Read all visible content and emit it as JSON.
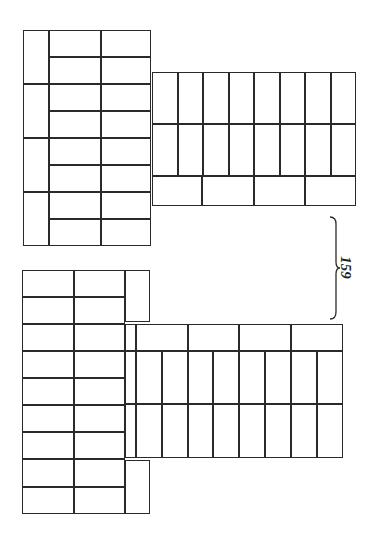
{
  "figure": {
    "stroke_color": "#2a2a2a",
    "background": "#ffffff",
    "reference_label": "159",
    "groups": [
      {
        "name": "upper-pattern",
        "bricks": [
          [
            23,
            30,
            26,
            54
          ],
          [
            23,
            84,
            26,
            54
          ],
          [
            23,
            138,
            26,
            54
          ],
          [
            23,
            192,
            26,
            54
          ],
          [
            49,
            30,
            52,
            27
          ],
          [
            101,
            30,
            50,
            27
          ],
          [
            49,
            57,
            52,
            27
          ],
          [
            101,
            57,
            50,
            27
          ],
          [
            49,
            84,
            52,
            27
          ],
          [
            101,
            84,
            50,
            27
          ],
          [
            49,
            111,
            52,
            27
          ],
          [
            101,
            111,
            50,
            27
          ],
          [
            49,
            138,
            52,
            27
          ],
          [
            101,
            138,
            50,
            27
          ],
          [
            49,
            165,
            52,
            27
          ],
          [
            101,
            165,
            50,
            27
          ],
          [
            49,
            192,
            52,
            27
          ],
          [
            101,
            192,
            50,
            27
          ],
          [
            49,
            219,
            52,
            27
          ],
          [
            101,
            219,
            50,
            27
          ],
          [
            152,
            72,
            26,
            52
          ],
          [
            178,
            72,
            25,
            52
          ],
          [
            203,
            72,
            26,
            52
          ],
          [
            229,
            72,
            25,
            52
          ],
          [
            254,
            72,
            26,
            52
          ],
          [
            280,
            72,
            25,
            52
          ],
          [
            305,
            72,
            26,
            52
          ],
          [
            331,
            72,
            25,
            52
          ],
          [
            152,
            124,
            26,
            52
          ],
          [
            178,
            124,
            25,
            52
          ],
          [
            203,
            124,
            26,
            52
          ],
          [
            229,
            124,
            25,
            52
          ],
          [
            254,
            124,
            26,
            52
          ],
          [
            280,
            124,
            25,
            52
          ],
          [
            305,
            124,
            26,
            52
          ],
          [
            331,
            124,
            25,
            52
          ],
          [
            152,
            176,
            50,
            30
          ],
          [
            202,
            176,
            52,
            30
          ],
          [
            254,
            176,
            51,
            30
          ],
          [
            305,
            176,
            51,
            30
          ]
        ]
      },
      {
        "name": "lower-pattern",
        "bricks": [
          [
            22,
            270,
            52,
            27
          ],
          [
            74,
            270,
            51,
            27
          ],
          [
            22,
            297,
            52,
            27
          ],
          [
            74,
            297,
            51,
            27
          ],
          [
            22,
            324,
            52,
            27
          ],
          [
            74,
            324,
            51,
            27
          ],
          [
            22,
            351,
            52,
            27
          ],
          [
            74,
            351,
            51,
            27
          ],
          [
            22,
            378,
            52,
            27
          ],
          [
            74,
            378,
            51,
            27
          ],
          [
            22,
            405,
            52,
            27
          ],
          [
            74,
            405,
            51,
            27
          ],
          [
            22,
            432,
            52,
            27
          ],
          [
            74,
            432,
            51,
            27
          ],
          [
            22,
            459,
            52,
            28
          ],
          [
            74,
            459,
            51,
            28
          ],
          [
            22,
            487,
            52,
            27
          ],
          [
            74,
            487,
            51,
            27
          ],
          [
            125,
            270,
            25,
            52
          ],
          [
            125,
            460,
            25,
            54
          ],
          [
            125,
            324,
            11,
            27
          ],
          [
            125,
            351,
            11,
            53
          ],
          [
            125,
            404,
            11,
            54
          ],
          [
            136,
            324,
            52,
            27
          ],
          [
            188,
            324,
            51,
            27
          ],
          [
            239,
            324,
            52,
            27
          ],
          [
            291,
            324,
            52,
            27
          ],
          [
            136,
            351,
            26,
            53
          ],
          [
            162,
            351,
            26,
            53
          ],
          [
            188,
            351,
            25,
            53
          ],
          [
            213,
            351,
            26,
            53
          ],
          [
            239,
            351,
            26,
            53
          ],
          [
            265,
            351,
            26,
            53
          ],
          [
            291,
            351,
            26,
            53
          ],
          [
            317,
            351,
            26,
            53
          ],
          [
            136,
            404,
            26,
            54
          ],
          [
            162,
            404,
            26,
            54
          ],
          [
            188,
            404,
            25,
            54
          ],
          [
            213,
            404,
            26,
            54
          ],
          [
            239,
            404,
            26,
            54
          ],
          [
            265,
            404,
            26,
            54
          ],
          [
            291,
            404,
            26,
            54
          ],
          [
            317,
            404,
            26,
            54
          ]
        ]
      }
    ]
  }
}
